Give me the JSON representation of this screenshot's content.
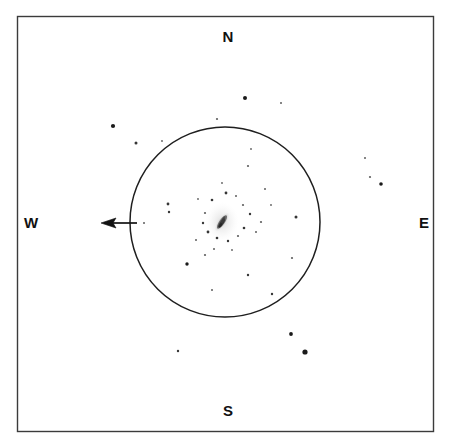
{
  "chart_data": {
    "type": "scatter",
    "title": "",
    "subtitle": "",
    "xlabel": "",
    "ylabel": "",
    "grid": false,
    "legend": null,
    "xlim": [
      17,
      434
    ],
    "ylim": [
      16,
      432
    ],
    "axis_convention": "sky-chart: north up, east left-to-right reversed (E at right, W at left)",
    "series": [
      {
        "name": "field-stars",
        "marker": "filled-circle",
        "color": "#1a1a1a",
        "points": [
          {
            "x": 113,
            "y": 126,
            "r": 2.1
          },
          {
            "x": 136,
            "y": 143,
            "r": 1.5
          },
          {
            "x": 162,
            "y": 141,
            "r": 0.9
          },
          {
            "x": 245,
            "y": 98,
            "r": 2.0
          },
          {
            "x": 281,
            "y": 103,
            "r": 1.0
          },
          {
            "x": 217,
            "y": 119,
            "r": 1.1
          },
          {
            "x": 251,
            "y": 149,
            "r": 0.9
          },
          {
            "x": 365,
            "y": 158,
            "r": 1.0
          },
          {
            "x": 370,
            "y": 177,
            "r": 1.1
          },
          {
            "x": 381,
            "y": 184,
            "r": 1.8
          },
          {
            "x": 291,
            "y": 334,
            "r": 1.9
          },
          {
            "x": 305,
            "y": 352,
            "r": 2.6
          },
          {
            "x": 178,
            "y": 351,
            "r": 1.2
          },
          {
            "x": 169,
            "y": 212,
            "r": 1.2
          },
          {
            "x": 144,
            "y": 223,
            "r": 1.0
          },
          {
            "x": 168,
            "y": 204,
            "r": 1.4
          },
          {
            "x": 187,
            "y": 264,
            "r": 1.7
          },
          {
            "x": 205,
            "y": 255,
            "r": 1.1
          },
          {
            "x": 248,
            "y": 275,
            "r": 1.2
          },
          {
            "x": 292,
            "y": 258,
            "r": 1.1
          },
          {
            "x": 272,
            "y": 294,
            "r": 1.2
          },
          {
            "x": 212,
            "y": 290,
            "r": 1.0
          },
          {
            "x": 296,
            "y": 217,
            "r": 1.5
          },
          {
            "x": 265,
            "y": 189,
            "r": 1.0
          },
          {
            "x": 248,
            "y": 166,
            "r": 1.1
          },
          {
            "x": 212,
            "y": 200,
            "r": 1.3
          },
          {
            "x": 226,
            "y": 193,
            "r": 1.4
          },
          {
            "x": 236,
            "y": 196,
            "r": 1.0
          },
          {
            "x": 243,
            "y": 205,
            "r": 1.1
          },
          {
            "x": 250,
            "y": 214,
            "r": 1.2
          },
          {
            "x": 244,
            "y": 228,
            "r": 1.3
          },
          {
            "x": 238,
            "y": 236,
            "r": 1.1
          },
          {
            "x": 228,
            "y": 241,
            "r": 1.2
          },
          {
            "x": 217,
            "y": 238,
            "r": 1.3
          },
          {
            "x": 208,
            "y": 232,
            "r": 1.4
          },
          {
            "x": 203,
            "y": 223,
            "r": 1.2
          },
          {
            "x": 205,
            "y": 213,
            "r": 1.1
          },
          {
            "x": 256,
            "y": 232,
            "r": 1.0
          },
          {
            "x": 261,
            "y": 222,
            "r": 1.1
          },
          {
            "x": 196,
            "y": 240,
            "r": 1.0
          },
          {
            "x": 232,
            "y": 250,
            "r": 0.9
          },
          {
            "x": 214,
            "y": 249,
            "r": 1.0
          },
          {
            "x": 271,
            "y": 205,
            "r": 0.9
          },
          {
            "x": 222,
            "y": 183,
            "r": 0.9
          },
          {
            "x": 198,
            "y": 199,
            "r": 0.9
          }
        ]
      },
      {
        "name": "central-object",
        "marker": "extended-smudge",
        "color": "#3a3a3a",
        "points": [
          {
            "x": 222,
            "y": 222,
            "r": 9.0,
            "label": "central extended object"
          }
        ]
      }
    ],
    "annotations": [
      {
        "name": "fov-circle",
        "type": "circle",
        "cx": 225,
        "cy": 222,
        "r": 95
      },
      {
        "name": "west-arrow",
        "type": "arrow",
        "x1": 137,
        "y1": 223,
        "x2": 103,
        "y2": 223,
        "direction": "west"
      },
      {
        "name": "frame",
        "type": "rect",
        "x": 17,
        "y": 16,
        "width": 417,
        "height": 416
      }
    ]
  },
  "compass": {
    "north_label": "N",
    "south_label": "S",
    "east_label": "E",
    "west_label": "W"
  },
  "colors": {
    "background": "#ffffff",
    "frame_stroke": "#3b3b3b",
    "circle_stroke": "#1f1f1f",
    "arrow_stroke": "#121212",
    "star_fill": "#1a1a1a",
    "label_text": "#111111"
  }
}
